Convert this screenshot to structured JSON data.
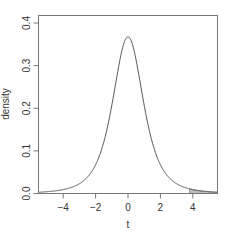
{
  "chart_data": {
    "type": "line",
    "title": "",
    "xlabel": "t",
    "ylabel": "density",
    "xlim": [
      -5.55,
      5.5
    ],
    "ylim": [
      0.0,
      0.42
    ],
    "x_ticks": [
      -4,
      -2,
      0,
      2,
      4
    ],
    "x_tick_labels": [
      "−4",
      "−2",
      "0",
      "2",
      "4"
    ],
    "y_ticks": [
      0.0,
      0.1,
      0.2,
      0.3,
      0.4
    ],
    "y_tick_labels": [
      "0.0",
      "0.1",
      "0.2",
      "0.3",
      "0.4"
    ],
    "grid": false,
    "legend": null,
    "series": [
      {
        "name": "t density (df = 3)",
        "df": 3,
        "x": [
          -5.5,
          -5,
          -4.5,
          -4,
          -3.5,
          -3,
          -2.5,
          -2,
          -1.5,
          -1,
          -0.5,
          0,
          0.5,
          1,
          1.5,
          2,
          2.5,
          3,
          3.5,
          4,
          4.5,
          5,
          5.5
        ],
        "values": [
          0.0047,
          0.0042,
          0.0061,
          0.0092,
          0.014,
          0.023,
          0.0382,
          0.0675,
          0.1169,
          0.2067,
          0.3116,
          0.3676,
          0.3116,
          0.2067,
          0.1169,
          0.0675,
          0.0382,
          0.023,
          0.014,
          0.0092,
          0.0061,
          0.0042,
          0.0047
        ],
        "color": "#555555"
      }
    ],
    "shaded_region": {
      "description": "right tail area under curve",
      "from_x": 3.8,
      "to_x": 5.5,
      "color": "#bbbbbb"
    }
  }
}
